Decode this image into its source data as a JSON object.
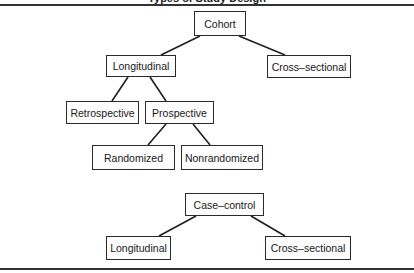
{
  "diagram": {
    "title_fragment": "Types of Study Design",
    "cohort": {
      "root": "Cohort",
      "level1": [
        "Longitudinal",
        "Cross–sectional"
      ],
      "longitudinal_children": [
        "Retrospective",
        "Prospective"
      ],
      "prospective_children": [
        "Randomized",
        "Nonrandomized"
      ]
    },
    "case_control": {
      "root": "Case–control",
      "children": [
        "Longitudinal",
        "Cross–sectional"
      ]
    }
  }
}
